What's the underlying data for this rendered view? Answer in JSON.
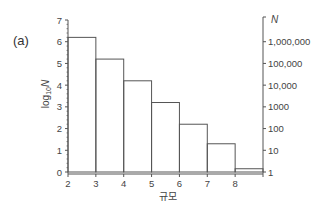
{
  "panel_label": "(a)",
  "chart_data": {
    "type": "bar",
    "subtype": "histogram",
    "title": "",
    "panel_label": "(a)",
    "xlabel": "규모",
    "ylabel": "log10N",
    "ylabel_right": "N",
    "bin_edges": [
      2,
      3,
      4,
      5,
      6,
      7,
      8,
      9
    ],
    "categories": [
      "2-3",
      "3-4",
      "4-5",
      "5-6",
      "6-7",
      "7-8",
      "8-9"
    ],
    "values": [
      6.2,
      5.2,
      4.2,
      3.2,
      2.2,
      1.3,
      0.15
    ],
    "xlim": [
      2,
      9
    ],
    "ylim": [
      0,
      7
    ],
    "x_ticks": [
      "2",
      "3",
      "4",
      "5",
      "6",
      "7",
      "8"
    ],
    "y_ticks": [
      "0",
      "1",
      "2",
      "3",
      "4",
      "5",
      "6",
      "7"
    ],
    "y_right_ticks": [
      {
        "log": 0,
        "label": "1"
      },
      {
        "log": 1,
        "label": "10"
      },
      {
        "log": 2,
        "label": "100"
      },
      {
        "log": 3,
        "label": "1000"
      },
      {
        "log": 4,
        "label": "10,000"
      },
      {
        "log": 5,
        "label": "100,000"
      },
      {
        "log": 6,
        "label": "1,000,000"
      }
    ],
    "grid": false,
    "legend": null
  }
}
